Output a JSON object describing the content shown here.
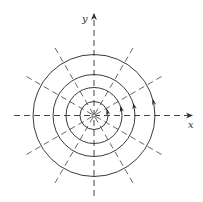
{
  "diagram": {
    "type": "polar-field-lines",
    "center": {
      "x": 94,
      "y": 115.5
    },
    "axes": {
      "x": {
        "label": "x",
        "from": 14,
        "to": 192
      },
      "y": {
        "label": "y",
        "from": 196,
        "to": 14
      }
    },
    "circles": [
      {
        "r": 14,
        "arrow": true
      },
      {
        "r": 28,
        "arrow": true
      },
      {
        "r": 41,
        "arrow": true
      },
      {
        "r": 61,
        "arrow": true
      }
    ],
    "radial_lines": {
      "angles_deg": [
        30,
        60,
        120,
        150
      ],
      "inner_length": 78,
      "dash": "6 4"
    },
    "arrow_direction": "counterclockwise",
    "arrow_angle_deg": 12,
    "colors": {
      "stroke": "#3a3a3a",
      "dashed": "#555555",
      "background": "#ffffff"
    }
  }
}
